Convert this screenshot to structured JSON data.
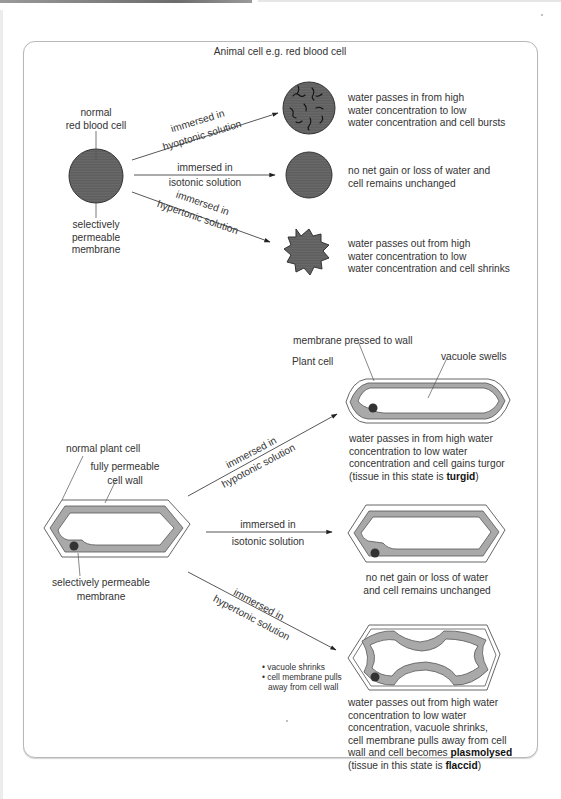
{
  "animal": {
    "title": "Animal cell e.g. red blood cell",
    "normal_label": [
      "normal",
      "red blood cell"
    ],
    "membrane_label": [
      "selectively",
      "permeable",
      "membrane"
    ],
    "arrows": [
      {
        "line1": "immersed in",
        "line2": "hyoptonic solution"
      },
      {
        "line1": "immersed in",
        "line2": "isotonic solution"
      },
      {
        "line1": "immersed in",
        "line2": "hypertonic solution"
      }
    ],
    "outcomes": [
      [
        "water passes in from high",
        "water concentration to low",
        "water concentration and cell bursts"
      ],
      [
        "no net gain or loss of water and",
        "cell remains unchanged"
      ],
      [
        "water passes out from high",
        "water concentration to low",
        "water concentration and cell shrinks"
      ]
    ]
  },
  "plant": {
    "title": "Plant cell",
    "normal_label": "normal plant cell",
    "wall_label": [
      "fully permeable",
      "cell wall"
    ],
    "membrane_label": [
      "selectively permeable",
      "membrane"
    ],
    "turgid_labels": {
      "membrane": "membrane pressed to wall",
      "vacuole": "vacuole swells"
    },
    "arrows": [
      {
        "line1": "immersed in",
        "line2": "hypotonic solution"
      },
      {
        "line1": "immersed in",
        "line2": "isotonic solution"
      },
      {
        "line1": "immersed in",
        "line2": "hypertonic solution"
      }
    ],
    "outcome_hypotonic": {
      "lines": [
        "water passes in from high water",
        "concentration to low water",
        "concentration and cell gains turgor"
      ],
      "last_prefix": "(tissue in this state is ",
      "last_bold": "turgid",
      "last_suffix": ")"
    },
    "outcome_isotonic": [
      "no net gain or loss of water",
      "and cell remains unchanged"
    ],
    "plasmolysis_notes": [
      "• vacuole shrinks",
      "• cell membrane pulls",
      "away from cell wall"
    ],
    "outcome_hypertonic": {
      "lines": [
        "water passes out from high water",
        "concentration to low water",
        "concentration, vacuole shrinks,",
        "cell membrane pulls away from cell"
      ],
      "line5_prefix": "wall and cell becomes ",
      "line5_bold": "plasmolysed",
      "last_prefix": "(tissue in this state is ",
      "last_bold": "flaccid",
      "last_suffix": ")"
    }
  },
  "colors": {
    "cell_fill": "#5e5e5e",
    "cytoplasm": "#a9a9a9",
    "line": "#444444",
    "frame": "#b8b8b8"
  }
}
